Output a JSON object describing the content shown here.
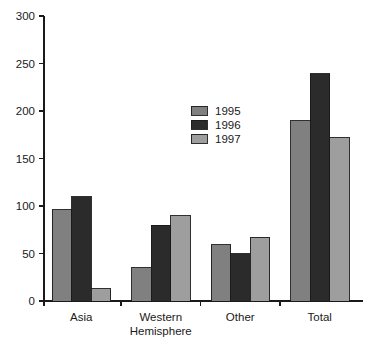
{
  "chart_data": {
    "type": "bar",
    "title": "",
    "subtitle": "",
    "xlabel": "",
    "ylabel": "",
    "categories": [
      "Asia",
      "Western Hemisphere",
      "Other",
      "Total"
    ],
    "category_lines": [
      [
        "Asia"
      ],
      [
        "Western",
        "Hemisphere"
      ],
      [
        "Other"
      ],
      [
        "Total"
      ]
    ],
    "series": [
      {
        "name": "1995",
        "color": "#808080",
        "values": [
          96,
          35,
          59,
          190
        ]
      },
      {
        "name": "1996",
        "color": "#2b2b2b",
        "values": [
          110,
          80,
          50,
          239
        ]
      },
      {
        "name": "1997",
        "color": "#9e9e9e",
        "values": [
          13,
          90,
          67,
          172
        ]
      }
    ],
    "ylim": [
      0,
      300
    ],
    "yticks": [
      0,
      50,
      100,
      150,
      200,
      250,
      300
    ],
    "ytick_labels": [
      "0",
      "50",
      "100",
      "150",
      "200",
      "250",
      "300"
    ],
    "grid": false,
    "legend_position": "upper-center",
    "legend_entries": [
      "1995",
      "1996",
      "1997"
    ],
    "axis_color": "#1a1a1a",
    "background_color": "#ffffff"
  }
}
